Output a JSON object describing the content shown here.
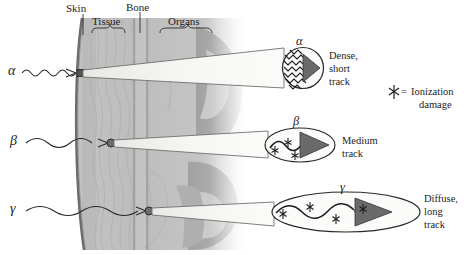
{
  "figure": {
    "legend": {
      "symbol_name": "ionization-damage-star",
      "equals": "=",
      "line1": "Ionization",
      "line2": "damage"
    },
    "anatomy_labels": [
      {
        "id": "skin",
        "text": "Skin",
        "x": 76,
        "y": 6,
        "bracket": false
      },
      {
        "id": "tissue",
        "text": "Tissue",
        "x": 100,
        "y": 20,
        "bracket": true
      },
      {
        "id": "bone",
        "text": "Bone",
        "x": 139,
        "y": 3,
        "bracket": false
      },
      {
        "id": "organs",
        "text": "Organs",
        "x": 185,
        "y": 20,
        "bracket": true
      }
    ],
    "rays": [
      {
        "id": "alpha",
        "symbol": "α",
        "entry_x": 80,
        "entry_y": 73,
        "detail_shape": "circle",
        "detail_symbol": "α",
        "description_lines": [
          "Dense,",
          "short",
          "track"
        ],
        "track_density": "dense",
        "track_length": "short"
      },
      {
        "id": "beta",
        "symbol": "β",
        "entry_x": 110,
        "entry_y": 143,
        "detail_shape": "ellipse",
        "detail_symbol": "β",
        "description_lines": [
          "Medium",
          "track"
        ],
        "track_density": "medium",
        "track_length": "medium"
      },
      {
        "id": "gamma",
        "symbol": "γ",
        "entry_x": 148,
        "entry_y": 211,
        "detail_shape": "ellipse",
        "detail_symbol": "γ",
        "description_lines": [
          "Diffuse,",
          "long",
          "track"
        ],
        "track_density": "diffuse",
        "track_length": "long"
      }
    ],
    "colors": {
      "ink": "#1d1d1d",
      "skin_line": "#6b6b6b",
      "body_light": "#d8d8d8",
      "body_mid": "#bdbdbd",
      "body_dark": "#9a9a9a",
      "cone_fill": "#f2f2ef",
      "arrow_fill": "#6e6e6e",
      "background": "#ffffff"
    }
  }
}
